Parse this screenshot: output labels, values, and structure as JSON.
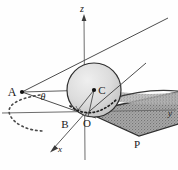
{
  "figure": {
    "type": "geometric-diagram-3d",
    "background_color": "#fefefe",
    "ink_color": "#2b2b2b",
    "sphere_fill": "#d8d8d8",
    "cone_fill": "#9a9a9a",
    "width": 178,
    "height": 170
  },
  "axes": {
    "z": {
      "label": "z",
      "direction": "up",
      "label_x": 82,
      "label_y": 12
    },
    "y": {
      "label": "y",
      "direction": "right",
      "label_x": 170,
      "label_y": 116
    },
    "x": {
      "label": "x",
      "direction": "down-left",
      "label_x": 60,
      "label_y": 152
    }
  },
  "points": [
    {
      "id": "A",
      "label": "A",
      "x": 22,
      "y": 92,
      "label_x": 14,
      "label_y": 95,
      "marker": true
    },
    {
      "id": "C",
      "label": "C",
      "x": 94,
      "y": 90,
      "label_x": 100,
      "label_y": 93,
      "marker": true
    },
    {
      "id": "B",
      "label": "B",
      "x": 70,
      "y": 113,
      "label_x": 64,
      "label_y": 127,
      "marker": false
    },
    {
      "id": "O",
      "label": "O",
      "x": 86,
      "y": 113,
      "label_x": 86,
      "label_y": 126,
      "marker": false
    },
    {
      "id": "P",
      "label": "P",
      "x": 139,
      "y": 136,
      "label_x": 136,
      "label_y": 147,
      "marker": false
    }
  ],
  "angles": [
    {
      "id": "theta",
      "label": "θ",
      "label_x": 43,
      "label_y": 98,
      "vertex": "A"
    }
  ],
  "elements": {
    "sphere": {
      "cx": 94,
      "cy": 90,
      "r": 27,
      "shaded": true
    },
    "contact_circle": {
      "style": "dotted",
      "cx": 90,
      "cy": 110,
      "rx": 22,
      "ry": 5
    },
    "dashed_conic": {
      "style": "dashed",
      "description": "open arc left of origin"
    },
    "cone_beam": {
      "style": "stippled",
      "description": "shaded conic beam to the right"
    },
    "tangent_lines_from_A": 2
  }
}
